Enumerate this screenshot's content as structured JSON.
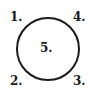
{
  "diagram": {
    "shape": "circle",
    "stroke_color": "#1a1a1a",
    "labels": {
      "top_left": "1.",
      "bottom_left": "2.",
      "bottom_right": "3.",
      "top_right": "4.",
      "center": "5."
    }
  }
}
